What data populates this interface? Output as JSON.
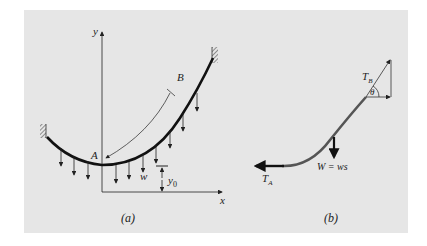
{
  "figure": {
    "background_color": "#e6e6e6",
    "curve_color": "#111111",
    "segment_color": "#555555",
    "panel_a": {
      "caption": "(a)",
      "axis_x_label": "x",
      "axis_y_label": "y",
      "point_a_label": "A",
      "point_b_label": "B",
      "load_label": "w",
      "offset_label": "y",
      "offset_subscript": "0"
    },
    "panel_b": {
      "caption": "(b)",
      "tension_a_label": "T",
      "tension_a_subscript": "A",
      "tension_b_label": "T",
      "tension_b_subscript": "B",
      "angle_label": "θ",
      "weight_label": "W = ws"
    }
  }
}
